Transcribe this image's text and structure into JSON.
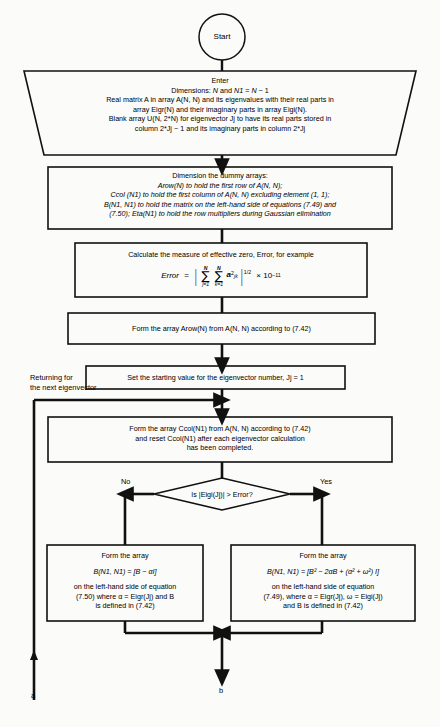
{
  "diagram": {
    "start": {
      "label": "Start"
    },
    "enter": {
      "line1": "Enter",
      "line2_a": "Dimensions: ",
      "line2_b": "N",
      "line2_c": " and ",
      "line2_d": "N1",
      "line2_e": " = ",
      "line2_f": "N",
      "line2_g": " − 1",
      "line3": "Real matrix A in array A(N, N) and its eigenvalues with their real parts in",
      "line4": "array Eigr(N) and their imaginary parts in array Eigi(N).",
      "line5": "Blank array U(N, 2*N) for eigenvector Jj to have its real parts stored in",
      "line6": "column 2*Jj − 1 and its imaginary parts in column 2*Jj"
    },
    "dimension_box": {
      "line1": "Dimension the dummy arrays:",
      "line2": "Arow(N) to hold the first row of A(N, N);",
      "line3": "Ccol (N1) to hold the first column of A(N, N) excluding element (1, 1);",
      "line4": "B(N1, N1) to hold the matrix on the left-hand side of equations (7.49) and",
      "line5": "(7.50); Eta(N1) to hold the row multipliers during Gaussian elimination"
    },
    "error_box": {
      "line1": "Calculate the measure of effective zero, Error, for example",
      "formula": {
        "lhs": "Error",
        "eq": "=",
        "sum1_top": "N",
        "sum1_bot": "j=1",
        "sum2_top": "N",
        "sum2_bot": "k=1",
        "term": "a",
        "term_sup": "2",
        "term_sub": "jk",
        "exponent": "1/2",
        "times": "× 10",
        "power": "−11"
      }
    },
    "arow_box": {
      "text": "Form the array Arow(N) from A(N, N) according to (7.42)"
    },
    "start_value_box": {
      "text": "Set the starting value for the eigenvector number, Jj = 1"
    },
    "returning_label": {
      "line1": "Returning for",
      "line2": "the next eigenvector"
    },
    "ccol_box": {
      "line1": "Form the array Ccol(N1) from A(N, N) according to (7.42)",
      "line2": "and reset Ccol(N1) after each eigenvector calculation",
      "line3": "has been completed."
    },
    "decision": {
      "text": "Is |Eigi(Jj)| > Error?",
      "no_label": "No",
      "yes_label": "Yes"
    },
    "left_box": {
      "line1": "Form the array",
      "formula": "B(N1, N1) = [B − αI]",
      "line3": "on the left-hand side of equation",
      "line4": "(7.50) where α = Eigr(Jj) and B",
      "line5": "is defined in (7.42)"
    },
    "right_box": {
      "line1": "Form the array",
      "formula": "B(N1, N1) = [B² − 2αB + (α² + ω²) I]",
      "line3": "on the left-hand side of equation",
      "line4": "(7.49), where α = Eigr(Jj), ω = Eigi(Jj)",
      "line5": "and B is defined in (7.42)"
    },
    "connectors": {
      "a": "a",
      "b": "b"
    },
    "colors": {
      "line": "#111111",
      "background": "#fbfbfa",
      "text": "#000000"
    }
  }
}
